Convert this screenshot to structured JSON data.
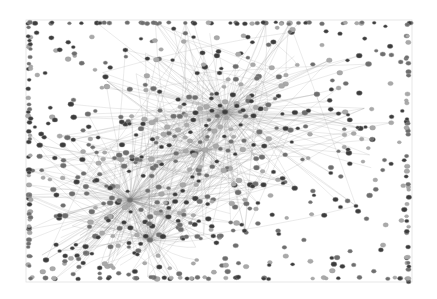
{
  "graph": {
    "type": "network",
    "frame": {
      "x": 26,
      "y": 20,
      "width": 386,
      "height": 262
    },
    "colors": {
      "background": "#ffffff",
      "edge": "#8a8a8a",
      "node_dark": "#3c3c3c",
      "node_mid": "#6e6e6e",
      "node_light": "#a9a9a9",
      "frame": "#e2e2e2"
    },
    "hubs": [
      {
        "x": 225,
        "y": 112,
        "spread": 70,
        "leaves": 150
      },
      {
        "x": 205,
        "y": 150,
        "spread": 45,
        "leaves": 60
      },
      {
        "x": 130,
        "y": 200,
        "spread": 55,
        "leaves": 150
      },
      {
        "x": 150,
        "y": 240,
        "spread": 35,
        "leaves": 40
      }
    ],
    "peripheral_nodes": 260,
    "border_nodes": 180,
    "seed": 7
  }
}
